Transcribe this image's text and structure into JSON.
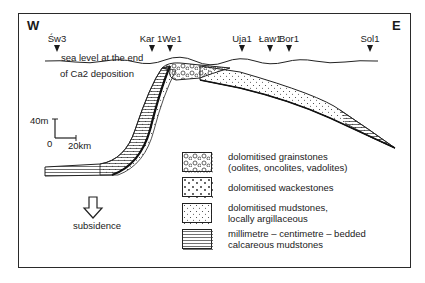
{
  "directions": {
    "west": "W",
    "east": "E"
  },
  "wells": [
    {
      "name": "Św3",
      "x": 57
    },
    {
      "name": "Kar 1",
      "x": 151
    },
    {
      "name": "We1",
      "x": 170
    },
    {
      "name": "Uja1",
      "x": 241
    },
    {
      "name": "Ław1",
      "x": 270
    },
    {
      "name": "Bor1",
      "x": 289
    },
    {
      "name": "Sol1",
      "x": 370
    }
  ],
  "sea_level_label": [
    "sea level at the end",
    "of Ca2 deposition"
  ],
  "scale": {
    "vertical": "40m",
    "origin": "0",
    "horizontal": "20km"
  },
  "subsidence_label": "subsidence",
  "legend": [
    {
      "pattern": "grainstone",
      "lines": [
        "dolomitised grainstones",
        "(oolites, oncolites, vadolites)"
      ]
    },
    {
      "pattern": "wackestone",
      "lines": [
        "dolomitised wackestones"
      ]
    },
    {
      "pattern": "mudstone",
      "lines": [
        "dolomitised mudstones,",
        "locally argillaceous"
      ]
    },
    {
      "pattern": "calcareous",
      "lines": [
        "millimetre – centimetre – bedded",
        "calcareous mudstones"
      ]
    },
    {
      "pattern": "dolomitic",
      "lines": [
        "centimetre – bedded",
        "dolomitic mudstones"
      ]
    }
  ]
}
